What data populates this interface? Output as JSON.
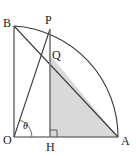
{
  "figure": {
    "labels": {
      "B": "B",
      "P": "P",
      "Q": "Q",
      "O": "O",
      "H": "H",
      "A": "A",
      "theta": "θ"
    },
    "colors": {
      "stroke": "#3a3a3a",
      "shaded_fill": "#d9d9d9",
      "background": "#ffffff",
      "label": "#1a1a1a"
    },
    "points": {
      "O": {
        "x": 14,
        "y": 137
      },
      "A": {
        "x": 118,
        "y": 137
      },
      "B": {
        "x": 14,
        "y": 26
      },
      "P": {
        "x": 50,
        "y": 29
      },
      "H": {
        "x": 50,
        "y": 137
      },
      "Q": {
        "x": 50,
        "y": 55
      }
    },
    "arc": {
      "center": "O",
      "radius": 111,
      "from": "B",
      "to": "A",
      "description": "quarter circle arc from B through P to A"
    },
    "segments": [
      {
        "name": "OB",
        "from": "O",
        "to": "B"
      },
      {
        "name": "OA",
        "from": "O",
        "to": "A"
      },
      {
        "name": "OP",
        "from": "O",
        "to": "P"
      },
      {
        "name": "BA",
        "from": "B",
        "to": "A"
      },
      {
        "name": "PH",
        "from": "P",
        "to": "H"
      }
    ],
    "shaded_region": {
      "name": "triangle-QHA",
      "vertices": [
        "Q",
        "H",
        "A"
      ]
    },
    "markers": {
      "right_angle_at": "H",
      "angle_theta_at": "O",
      "angle_theta_between": [
        "OA",
        "OP"
      ]
    }
  }
}
